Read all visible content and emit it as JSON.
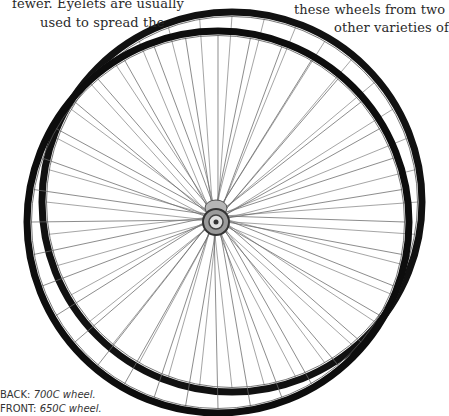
{
  "body_text": {
    "left_column": [
      "fewer. Eyelets are usually",
      "used to spread the"
    ],
    "right_column": [
      "these wheels from two",
      "other varieties of"
    ]
  },
  "caption": {
    "back_label": "BACK:",
    "back_value": "700C wheel.",
    "front_label": "FRONT:",
    "front_value": "650C wheel."
  },
  "image": {
    "subject": "bicycle wheels",
    "back_wheel": {
      "size": "700C",
      "rim_color": "#111111"
    },
    "front_wheel": {
      "size": "650C",
      "rim_color": "#0d0d0d"
    },
    "spoke_color": "#6a6a6a",
    "hub_color": "#9a9a9a"
  }
}
